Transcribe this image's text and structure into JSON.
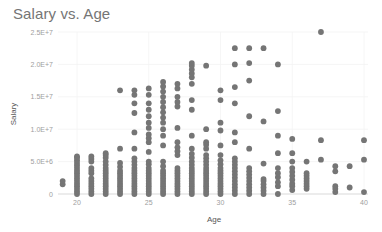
{
  "chart_data": {
    "type": "scatter",
    "title": "Salary vs. Age",
    "xlabel": "Age",
    "ylabel": "Salary",
    "xlim": [
      19,
      40
    ],
    "ylim": [
      0,
      25000000
    ],
    "x_ticks": [
      20,
      25,
      30,
      35,
      40
    ],
    "y_ticks": [
      0,
      5000000,
      10000000,
      15000000,
      20000000,
      25000000
    ],
    "y_tick_labels": [
      "0",
      "5.0E+6",
      "1.0E+7",
      "1.5E+7",
      "2.0E+7",
      "2.5E+7"
    ],
    "grid": true,
    "legend": "none",
    "marker_color": "#757575",
    "points_by_age": {
      "19": [
        1.5,
        2.0
      ],
      "20": [
        0,
        0.4,
        0.8,
        1.2,
        1.6,
        2.0,
        2.4,
        2.8,
        3.2,
        3.6,
        4.0,
        4.4,
        4.8,
        5.2,
        5.6,
        5.8
      ],
      "21": [
        0,
        0.4,
        0.8,
        1.2,
        1.6,
        2.0,
        2.4,
        3.2,
        3.6,
        4.0,
        5.0,
        5.4,
        5.8
      ],
      "22": [
        0,
        0.4,
        0.8,
        1.2,
        1.6,
        2.0,
        2.4,
        2.8,
        3.2,
        3.6,
        4.0,
        4.5,
        5.0,
        5.6,
        6.0,
        6.3
      ],
      "23": [
        0,
        0.4,
        0.8,
        1.2,
        1.6,
        2.0,
        2.4,
        2.8,
        3.2,
        3.6,
        4.2,
        4.8,
        7.0,
        16.0
      ],
      "24": [
        0,
        0.4,
        0.8,
        1.2,
        1.6,
        2.0,
        2.4,
        2.8,
        3.2,
        3.6,
        4.0,
        4.5,
        5.0,
        5.5,
        7.0,
        9.5,
        12.5,
        14.0,
        15.3,
        16.0
      ],
      "25": [
        0,
        0.4,
        0.8,
        1.2,
        1.6,
        2.0,
        2.4,
        2.8,
        3.2,
        3.6,
        4.0,
        4.6,
        5.0,
        6.5,
        8.0,
        8.6,
        9.2,
        10.2,
        11.0,
        12.0,
        13.0,
        14.0,
        15.3,
        16.3
      ],
      "26": [
        0,
        0.4,
        0.8,
        1.2,
        1.6,
        2.0,
        2.4,
        2.8,
        3.2,
        3.6,
        4.3,
        5.0,
        7.5,
        9.0,
        10.0,
        11.0,
        11.8,
        12.6,
        13.4,
        14.2,
        15.0,
        15.8,
        16.6,
        17.3
      ],
      "27": [
        0,
        0.4,
        0.8,
        1.2,
        1.6,
        2.0,
        2.4,
        2.8,
        3.2,
        3.6,
        4.0,
        6.0,
        6.6,
        7.2,
        8.0,
        10.2,
        13.5,
        14.2,
        15.0,
        16.3,
        17.0
      ],
      "28": [
        0,
        0.4,
        0.8,
        1.2,
        1.6,
        2.0,
        2.4,
        2.8,
        3.2,
        3.6,
        4.0,
        4.5,
        5.0,
        5.6,
        6.2,
        7.0,
        9.0,
        13.0,
        14.5,
        17.0,
        18.0,
        18.6,
        19.2,
        19.8,
        20.2
      ],
      "29": [
        0,
        0.4,
        0.8,
        1.2,
        1.6,
        2.0,
        2.4,
        2.8,
        3.2,
        3.6,
        4.0,
        4.5,
        5.0,
        5.5,
        6.0,
        7.0,
        7.6,
        8.0,
        10.0,
        19.8
      ],
      "30": [
        0,
        0.4,
        0.8,
        1.2,
        1.6,
        2.0,
        2.4,
        2.8,
        3.2,
        3.6,
        4.0,
        4.6,
        5.2,
        6.0,
        7.5,
        9.8,
        11.0,
        14.5,
        16.0
      ],
      "31": [
        0,
        0.5,
        1.0,
        1.5,
        2.0,
        2.5,
        3.0,
        3.5,
        4.0,
        4.5,
        5.0,
        5.5,
        8.0,
        9.5,
        14.0,
        16.5,
        20.0,
        22.5
      ],
      "32": [
        0,
        0.5,
        1.0,
        1.5,
        2.0,
        2.5,
        3.0,
        3.5,
        4.0,
        7.0,
        12.0,
        17.5,
        20.2,
        22.5
      ],
      "33": [
        0,
        0.5,
        1.0,
        1.5,
        2.0,
        2.3,
        4.7,
        11.2,
        22.5
      ],
      "34": [
        0,
        1.2,
        1.8,
        2.6,
        3.2,
        4.0,
        6.3,
        9.0,
        12.8,
        20.0
      ],
      "35": [
        0.6,
        1.2,
        1.6,
        2.2,
        2.8,
        3.4,
        4.0,
        5.0,
        6.3,
        8.5
      ],
      "36": [
        0.8,
        1.2,
        1.6,
        2.0,
        2.4,
        2.8,
        3.2,
        5.0
      ],
      "37": [
        5.3,
        8.3,
        25.0
      ],
      "38": [
        0.3,
        0.8,
        1.2,
        3.5,
        4.3
      ],
      "39": [
        1.0,
        4.3
      ],
      "40": [
        0.3,
        5.3,
        8.3
      ]
    },
    "units_note": "values in millions"
  }
}
